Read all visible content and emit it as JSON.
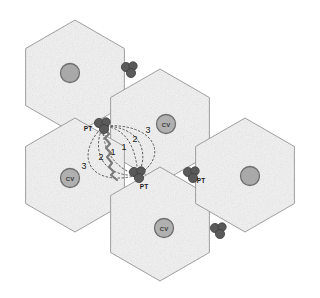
{
  "figure": {
    "caption_clipped": "Fig. 1  Hexagonal cell layout showing PT nodes, CV nodes and hop distances"
  },
  "palette": {
    "page_background": "#ffffff",
    "cell_fill": "#f2f2f2",
    "cell_fill_speckle": "#e2e2e2",
    "cell_stroke": "#8d8d8d",
    "node_dark": "#5a5a5a",
    "node_dark_stroke": "#3f3f3f",
    "cv_fill": "#b0b0b0",
    "cv_stroke": "#6f6f6f",
    "plain_circle_fill": "#a9a9a9",
    "plain_circle_stroke": "#6f6f6f",
    "contour_stroke": "#4a4a4a",
    "zigzag_stroke": "#7a7a7a",
    "label_color": "#1a1a1a"
  },
  "cells": [
    {
      "id": "cell-top-left",
      "cx": 75,
      "cy": 77
    },
    {
      "id": "cell-top-center",
      "cx": 160,
      "cy": 126
    },
    {
      "id": "cell-left",
      "cx": 75,
      "cy": 175
    },
    {
      "id": "cell-bottom-center",
      "cx": 160,
      "cy": 224
    },
    {
      "id": "cell-right",
      "cx": 245,
      "cy": 175
    }
  ],
  "cell_geometry": {
    "radius": 57,
    "orientation": "flat-top"
  },
  "pt_clusters": [
    {
      "id": "pt-upper",
      "x": 103,
      "y": 126,
      "label": "PT",
      "label_dx": -15,
      "label_dy": 5,
      "labeled": true
    },
    {
      "id": "pt-lower",
      "x": 138,
      "y": 175,
      "label": "PT",
      "label_dx": 6,
      "label_dy": 14,
      "labeled": true
    },
    {
      "id": "pt-right",
      "x": 192,
      "y": 175,
      "label": "PT",
      "label_dx": 9,
      "label_dy": 8,
      "labeled": true
    },
    {
      "id": "node-top",
      "x": 130,
      "y": 70,
      "label": "",
      "label_dx": 0,
      "label_dy": 0,
      "labeled": false
    },
    {
      "id": "node-lower-right",
      "x": 219,
      "y": 231,
      "label": "",
      "label_dx": 0,
      "label_dy": 0,
      "labeled": false
    }
  ],
  "cluster_dots": [
    {
      "dx": -4,
      "dy": -3,
      "r": 4.6
    },
    {
      "dx": 3,
      "dy": -4,
      "r": 4.2
    },
    {
      "dx": 1,
      "dy": 3,
      "r": 4.6
    }
  ],
  "cv_nodes": [
    {
      "id": "cv-top-center",
      "cx": 166,
      "cy": 124,
      "label": "CV"
    },
    {
      "id": "cv-left",
      "cx": 70,
      "cy": 178,
      "label": "CV"
    },
    {
      "id": "cv-bottom",
      "cx": 164,
      "cy": 228,
      "label": "CV"
    }
  ],
  "plain_nodes": [
    {
      "id": "node-top-left-center",
      "cx": 70,
      "cy": 73
    },
    {
      "id": "node-right-center",
      "cx": 250,
      "cy": 176
    }
  ],
  "hop_labels": [
    {
      "id": "hop-right-1",
      "text": "1",
      "x": 124,
      "y": 150
    },
    {
      "id": "hop-right-2",
      "text": "2",
      "x": 135,
      "y": 142
    },
    {
      "id": "hop-right-3",
      "text": "3",
      "x": 148,
      "y": 133
    },
    {
      "id": "hop-left-1",
      "text": "1",
      "x": 113,
      "y": 155
    },
    {
      "id": "hop-left-2",
      "text": "2",
      "x": 101,
      "y": 160
    },
    {
      "id": "hop-left-3",
      "text": "3",
      "x": 84,
      "y": 169
    }
  ],
  "contours": {
    "description": "dotted hop-distance arcs joining the two central PT clusters",
    "dash_pattern": "1.6 2.4",
    "count": 6
  },
  "interference_link": {
    "description": "zigzag link between upper PT and lower PT",
    "from": "pt-upper",
    "to": "pt-lower"
  }
}
